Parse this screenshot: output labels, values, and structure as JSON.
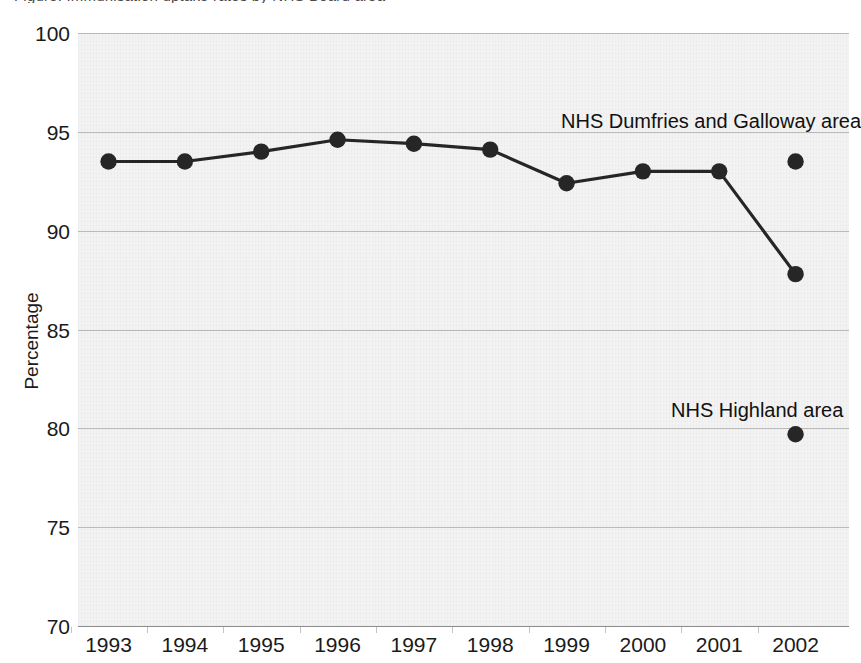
{
  "figure": {
    "title_sliver": "Figure: Immunisation uptake rates by NHS Board area",
    "background_color": "#f3f3f3",
    "series_color": "#262626",
    "gridline_color": "#b9b9b9"
  },
  "chart_data": {
    "type": "line",
    "title": "",
    "xlabel": "",
    "ylabel": "Percentage",
    "x": [
      1993,
      1994,
      1995,
      1996,
      1997,
      1998,
      1999,
      2000,
      2001,
      2002
    ],
    "xtick_labels": [
      "1993",
      "1994",
      "1995",
      "1996",
      "1997",
      "1998",
      "1999",
      "2000",
      "2001",
      "2002"
    ],
    "ytick_labels": [
      "70",
      "75",
      "80",
      "85",
      "90",
      "95",
      "100"
    ],
    "yticks": [
      70,
      75,
      80,
      85,
      90,
      95,
      100
    ],
    "ylim": [
      70,
      100
    ],
    "xlim": [
      1992.6,
      2002.7
    ],
    "grid": true,
    "legend": "annotations",
    "series": [
      {
        "name": "NHS Dumfries and Galloway area",
        "marker": "filled-circle",
        "line": true,
        "values": [
          93.5,
          93.5,
          94.0,
          94.6,
          94.4,
          94.1,
          92.4,
          93.0,
          93.0,
          87.8
        ]
      },
      {
        "name": "NHS Dumfries and Galloway area 2002 point",
        "marker": "filled-circle",
        "line": false,
        "x": [
          2002
        ],
        "values": [
          93.5
        ]
      },
      {
        "name": "NHS Highland area",
        "marker": "filled-circle",
        "line": false,
        "x": [
          2002
        ],
        "values": [
          79.7
        ]
      }
    ],
    "annotations": [
      {
        "text": "NHS Dumfries and Galloway area",
        "x": 2000.6,
        "y": 95.3
      },
      {
        "text": "NHS Highland area",
        "x": 2001.6,
        "y": 80.9
      }
    ]
  }
}
